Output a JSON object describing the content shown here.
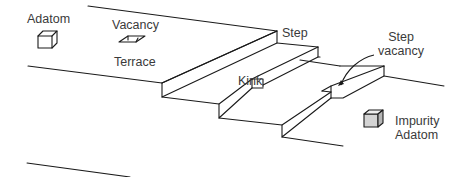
{
  "diagram": {
    "colors": {
      "line": "#1a1a1a",
      "text": "#3a3a3a",
      "impurity_fill": "#c8c8c8",
      "background": "#ffffff"
    },
    "labels": {
      "adatom": "Adatom",
      "vacancy": "Vacancy",
      "terrace": "Terrace",
      "step": "Step",
      "kink": "Kink",
      "step_vacancy_line1": "Step",
      "step_vacancy_line2": "vacancy",
      "impurity_line1": "Impurity",
      "impurity_line2": "Adatom"
    },
    "icons": {
      "adatom": "cube-icon",
      "vacancy": "rhombus-hole-icon",
      "impurity": "shaded-cube-icon",
      "pointer": "curved-arrow-icon"
    }
  }
}
